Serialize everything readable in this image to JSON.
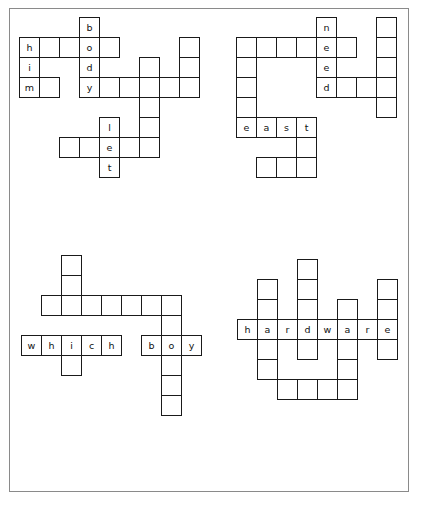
{
  "page": {
    "background_color": "#ffffff",
    "border_color": "#8a8a8a",
    "cell_border_color": "#1a1a1a",
    "letter_color": "#111111",
    "cell_size_px": 21
  },
  "puzzles": [
    {
      "name": "puzzle-top-left",
      "origin": {
        "x": 18,
        "y": 16
      },
      "answers": [
        {
          "word": "body",
          "direction": "down",
          "col": 3,
          "row": 0
        },
        {
          "word": "him",
          "direction": "down",
          "col": 0,
          "row": 1
        }
      ],
      "cells": [
        {
          "col": 3,
          "row": 0,
          "letter": "b"
        },
        {
          "col": 0,
          "row": 1,
          "letter": "h"
        },
        {
          "col": 1,
          "row": 1,
          "letter": ""
        },
        {
          "col": 2,
          "row": 1,
          "letter": ""
        },
        {
          "col": 3,
          "row": 1,
          "letter": "o"
        },
        {
          "col": 4,
          "row": 1,
          "letter": ""
        },
        {
          "col": 8,
          "row": 1,
          "letter": ""
        },
        {
          "col": 0,
          "row": 2,
          "letter": "i"
        },
        {
          "col": 3,
          "row": 2,
          "letter": "d"
        },
        {
          "col": 6,
          "row": 2,
          "letter": ""
        },
        {
          "col": 8,
          "row": 2,
          "letter": ""
        },
        {
          "col": 0,
          "row": 3,
          "letter": "m"
        },
        {
          "col": 1,
          "row": 3,
          "letter": ""
        },
        {
          "col": 3,
          "row": 3,
          "letter": "y"
        },
        {
          "col": 4,
          "row": 3,
          "letter": ""
        },
        {
          "col": 5,
          "row": 3,
          "letter": ""
        },
        {
          "col": 6,
          "row": 3,
          "letter": ""
        },
        {
          "col": 7,
          "row": 3,
          "letter": ""
        },
        {
          "col": 8,
          "row": 3,
          "letter": ""
        },
        {
          "col": 6,
          "row": 4,
          "letter": ""
        },
        {
          "col": 4,
          "row": 5,
          "letter": "l"
        },
        {
          "col": 6,
          "row": 5,
          "letter": ""
        },
        {
          "col": 2,
          "row": 6,
          "letter": ""
        },
        {
          "col": 3,
          "row": 6,
          "letter": ""
        },
        {
          "col": 4,
          "row": 6,
          "letter": "e"
        },
        {
          "col": 5,
          "row": 6,
          "letter": ""
        },
        {
          "col": 6,
          "row": 6,
          "letter": ""
        },
        {
          "col": 4,
          "row": 7,
          "letter": "t"
        }
      ]
    },
    {
      "name": "puzzle-top-right",
      "origin": {
        "x": 235,
        "y": 16
      },
      "answers": [
        {
          "word": "need",
          "direction": "down",
          "col": 4,
          "row": 0
        },
        {
          "word": "east",
          "direction": "across",
          "col": 0,
          "row": 5
        }
      ],
      "cells": [
        {
          "col": 4,
          "row": 0,
          "letter": "n"
        },
        {
          "col": 7,
          "row": 0,
          "letter": ""
        },
        {
          "col": 0,
          "row": 1,
          "letter": ""
        },
        {
          "col": 1,
          "row": 1,
          "letter": ""
        },
        {
          "col": 2,
          "row": 1,
          "letter": ""
        },
        {
          "col": 3,
          "row": 1,
          "letter": ""
        },
        {
          "col": 4,
          "row": 1,
          "letter": "e"
        },
        {
          "col": 5,
          "row": 1,
          "letter": ""
        },
        {
          "col": 7,
          "row": 1,
          "letter": ""
        },
        {
          "col": 0,
          "row": 2,
          "letter": ""
        },
        {
          "col": 4,
          "row": 2,
          "letter": "e"
        },
        {
          "col": 7,
          "row": 2,
          "letter": ""
        },
        {
          "col": 0,
          "row": 3,
          "letter": ""
        },
        {
          "col": 4,
          "row": 3,
          "letter": "d"
        },
        {
          "col": 5,
          "row": 3,
          "letter": ""
        },
        {
          "col": 6,
          "row": 3,
          "letter": ""
        },
        {
          "col": 7,
          "row": 3,
          "letter": ""
        },
        {
          "col": 0,
          "row": 4,
          "letter": ""
        },
        {
          "col": 7,
          "row": 4,
          "letter": ""
        },
        {
          "col": 0,
          "row": 5,
          "letter": "e"
        },
        {
          "col": 1,
          "row": 5,
          "letter": "a"
        },
        {
          "col": 2,
          "row": 5,
          "letter": "s"
        },
        {
          "col": 3,
          "row": 5,
          "letter": "t"
        },
        {
          "col": 3,
          "row": 6,
          "letter": ""
        },
        {
          "col": 1,
          "row": 7,
          "letter": ""
        },
        {
          "col": 2,
          "row": 7,
          "letter": ""
        },
        {
          "col": 3,
          "row": 7,
          "letter": ""
        }
      ]
    },
    {
      "name": "puzzle-bottom-left",
      "origin": {
        "x": 20,
        "y": 254
      },
      "answers": [
        {
          "word": "which",
          "direction": "across",
          "col": 0,
          "row": 4
        },
        {
          "word": "boy",
          "direction": "across",
          "col": 7,
          "row": 4
        }
      ],
      "cells": [
        {
          "col": 2,
          "row": 0,
          "letter": ""
        },
        {
          "col": 2,
          "row": 1,
          "letter": ""
        },
        {
          "col": 1,
          "row": 2,
          "letter": ""
        },
        {
          "col": 2,
          "row": 2,
          "letter": ""
        },
        {
          "col": 3,
          "row": 2,
          "letter": ""
        },
        {
          "col": 4,
          "row": 2,
          "letter": ""
        },
        {
          "col": 5,
          "row": 2,
          "letter": ""
        },
        {
          "col": 6,
          "row": 2,
          "letter": ""
        },
        {
          "col": 7,
          "row": 2,
          "letter": ""
        },
        {
          "col": 7,
          "row": 3,
          "letter": ""
        },
        {
          "col": 0,
          "row": 4,
          "letter": "w"
        },
        {
          "col": 1,
          "row": 4,
          "letter": "h"
        },
        {
          "col": 2,
          "row": 4,
          "letter": "i"
        },
        {
          "col": 3,
          "row": 4,
          "letter": "c"
        },
        {
          "col": 4,
          "row": 4,
          "letter": "h"
        },
        {
          "col": 6,
          "row": 4,
          "letter": "b"
        },
        {
          "col": 7,
          "row": 4,
          "letter": "o"
        },
        {
          "col": 8,
          "row": 4,
          "letter": "y"
        },
        {
          "col": 2,
          "row": 5,
          "letter": ""
        },
        {
          "col": 7,
          "row": 5,
          "letter": ""
        },
        {
          "col": 7,
          "row": 6,
          "letter": ""
        },
        {
          "col": 7,
          "row": 7,
          "letter": ""
        }
      ]
    },
    {
      "name": "puzzle-bottom-right",
      "origin": {
        "x": 236,
        "y": 258
      },
      "answers": [
        {
          "word": "hardware",
          "direction": "across",
          "col": 0,
          "row": 3
        }
      ],
      "cells": [
        {
          "col": 3,
          "row": 0,
          "letter": ""
        },
        {
          "col": 1,
          "row": 1,
          "letter": ""
        },
        {
          "col": 3,
          "row": 1,
          "letter": ""
        },
        {
          "col": 7,
          "row": 1,
          "letter": ""
        },
        {
          "col": 1,
          "row": 2,
          "letter": ""
        },
        {
          "col": 3,
          "row": 2,
          "letter": ""
        },
        {
          "col": 5,
          "row": 2,
          "letter": ""
        },
        {
          "col": 7,
          "row": 2,
          "letter": ""
        },
        {
          "col": 0,
          "row": 3,
          "letter": "h"
        },
        {
          "col": 1,
          "row": 3,
          "letter": "a"
        },
        {
          "col": 2,
          "row": 3,
          "letter": "r"
        },
        {
          "col": 3,
          "row": 3,
          "letter": "d"
        },
        {
          "col": 4,
          "row": 3,
          "letter": "w"
        },
        {
          "col": 5,
          "row": 3,
          "letter": "a"
        },
        {
          "col": 6,
          "row": 3,
          "letter": "r"
        },
        {
          "col": 7,
          "row": 3,
          "letter": "e"
        },
        {
          "col": 1,
          "row": 4,
          "letter": ""
        },
        {
          "col": 3,
          "row": 4,
          "letter": ""
        },
        {
          "col": 5,
          "row": 4,
          "letter": ""
        },
        {
          "col": 7,
          "row": 4,
          "letter": ""
        },
        {
          "col": 1,
          "row": 5,
          "letter": ""
        },
        {
          "col": 5,
          "row": 5,
          "letter": ""
        },
        {
          "col": 2,
          "row": 6,
          "letter": ""
        },
        {
          "col": 3,
          "row": 6,
          "letter": ""
        },
        {
          "col": 4,
          "row": 6,
          "letter": ""
        },
        {
          "col": 5,
          "row": 6,
          "letter": ""
        }
      ]
    }
  ]
}
